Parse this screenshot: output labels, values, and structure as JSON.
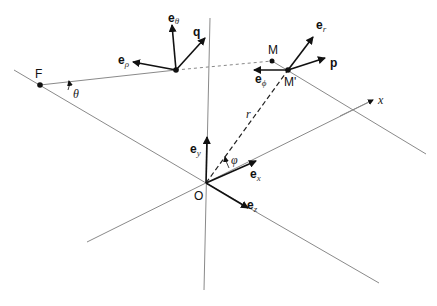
{
  "points": {
    "F": "F",
    "M": "M",
    "M_prime": "M'",
    "O": "O"
  },
  "vectors": {
    "e_theta": {
      "base": "e",
      "sub": "θ"
    },
    "q": {
      "base": "q"
    },
    "e_rho": {
      "base": "e",
      "sub": "ρ"
    },
    "e_r": {
      "base": "e",
      "sub": "r"
    },
    "p": {
      "base": "p"
    },
    "e_phi": {
      "base": "e",
      "sub": "ϕ"
    },
    "e_y": {
      "base": "e",
      "sub": "y"
    },
    "e_x": {
      "base": "e",
      "sub": "x"
    },
    "e_z": {
      "base": "e",
      "sub": "z"
    }
  },
  "labels": {
    "theta": "θ",
    "phi": "φ",
    "r": "r",
    "x_axis": "x"
  },
  "colors": {
    "background": "#ffffff",
    "vector": "#111111",
    "line": "#8a8a8a"
  }
}
